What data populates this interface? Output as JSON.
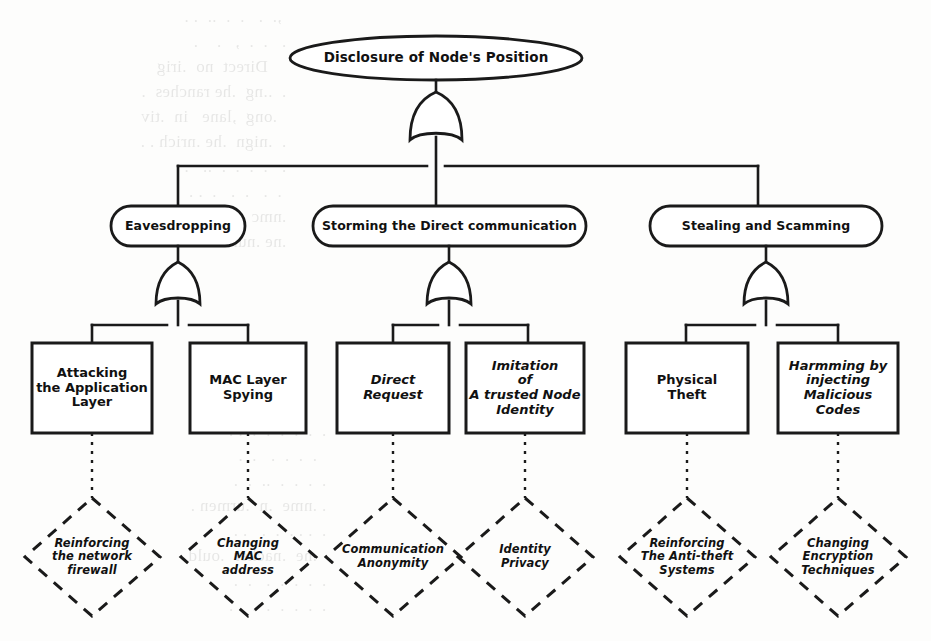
{
  "diagram": {
    "title": "Disclosure of Node's Position",
    "type": "attack-tree",
    "colors": {
      "ink": "#1a1a1a",
      "background": "#fdfdfc"
    },
    "root": {
      "id": "root",
      "label": "Disclosure of Node's Position",
      "shape": "ellipse",
      "gate": "OR"
    },
    "branches": [
      {
        "id": "eavesdropping",
        "label": "Eavesdropping",
        "shape": "ellipse",
        "gate": "OR",
        "leaves": [
          {
            "id": "attacking-application-layer",
            "label": "Attacking\nthe Application\nLayer",
            "shape": "rect",
            "italic": false,
            "countermeasure": {
              "id": "reinforcing-network-firewall",
              "label": "Reinforcing\nthe network\nfirewall",
              "shape": "diamond"
            }
          },
          {
            "id": "mac-layer-spying",
            "label": "MAC Layer\nSpying",
            "shape": "rect",
            "italic": false,
            "countermeasure": {
              "id": "changing-mac-address",
              "label": "Changing\nMAC\naddress",
              "shape": "diamond"
            }
          }
        ]
      },
      {
        "id": "storming-direct-communication",
        "label": "Storming the Direct communication",
        "shape": "ellipse",
        "gate": "OR",
        "leaves": [
          {
            "id": "direct-request",
            "label": "Direct\nRequest",
            "shape": "rect",
            "italic": true,
            "countermeasure": {
              "id": "communication-anonymity",
              "label": "Communication\nAnonymity",
              "shape": "diamond"
            }
          },
          {
            "id": "imitation-of-trusted-node-identity",
            "label": "Imitation\nof\nA trusted Node\nIdentity",
            "shape": "rect",
            "italic": true,
            "countermeasure": {
              "id": "identity-privacy",
              "label": "Identity\nPrivacy",
              "shape": "diamond"
            }
          }
        ]
      },
      {
        "id": "stealing-and-scamming",
        "label": "Stealing and Scamming",
        "shape": "ellipse",
        "gate": "OR",
        "leaves": [
          {
            "id": "physical-theft",
            "label": "Physical\nTheft",
            "shape": "rect",
            "italic": false,
            "countermeasure": {
              "id": "reinforcing-anti-theft-systems",
              "label": "Reinforcing\nThe Anti-theft\nSystems",
              "shape": "diamond"
            }
          },
          {
            "id": "harmming-by-injecting-malicious-codes",
            "label": "Harmming by\ninjecting\nMalicious\nCodes",
            "shape": "rect",
            "italic": true,
            "countermeasure": {
              "id": "changing-encryption-techniques",
              "label": "Changing\nEncryption\nTechniques",
              "shape": "diamond"
            }
          }
        ]
      }
    ]
  }
}
